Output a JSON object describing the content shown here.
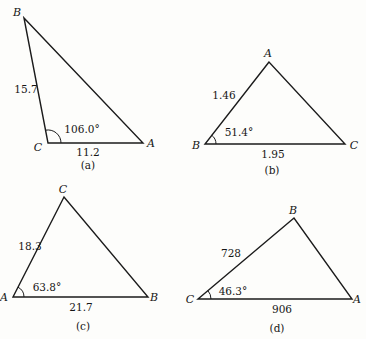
{
  "figure": {
    "background_color": "#fdfdfb",
    "line_color": "#1b1b1b",
    "triangles": [
      {
        "id": "a",
        "caption": "(a)",
        "apex_label": "B",
        "bottom_left_label": "C",
        "bottom_right_label": "A",
        "slant_side_value": "15.7",
        "bottom_side_value": "11.2",
        "angle_value": "106.0°",
        "angle_at_vertex": "C"
      },
      {
        "id": "b",
        "caption": "(b)",
        "apex_label": "A",
        "bottom_left_label": "B",
        "bottom_right_label": "C",
        "slant_side_value": "1.46",
        "bottom_side_value": "1.95",
        "angle_value": "51.4°",
        "angle_at_vertex": "B"
      },
      {
        "id": "c",
        "caption": "(c)",
        "apex_label": "C",
        "bottom_left_label": "A",
        "bottom_right_label": "B",
        "slant_side_value": "18.3",
        "bottom_side_value": "21.7",
        "angle_value": "63.8°",
        "angle_at_vertex": "A"
      },
      {
        "id": "d",
        "caption": "(d)",
        "apex_label": "B",
        "bottom_left_label": "C",
        "bottom_right_label": "A",
        "slant_side_value": "728",
        "bottom_side_value": "906",
        "angle_value": "46.3°",
        "angle_at_vertex": "C"
      }
    ]
  }
}
